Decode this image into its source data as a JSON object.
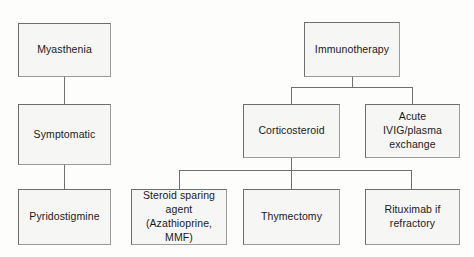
{
  "diagram": {
    "type": "flowchart",
    "colors": {
      "node_fill": "#f6f6f4",
      "node_border": "#6e6e6e",
      "edge": "#6f6f6f",
      "text": "#1a1a1a",
      "background": "#fdfdfc"
    },
    "nodes": [
      {
        "id": "myasthenia",
        "label": "Myasthenia"
      },
      {
        "id": "symptomatic",
        "label": "Symptomatic"
      },
      {
        "id": "pyridostigmine",
        "label": "Pyridostigmine"
      },
      {
        "id": "immunotherapy",
        "label": "Immunotherapy"
      },
      {
        "id": "corticosteroid",
        "label": "Corticosteroid"
      },
      {
        "id": "acute-ivig",
        "label": "Acute\nIVIG/plasma\nexchange"
      },
      {
        "id": "steroid-sparing",
        "label": "Steroid sparing\nagent\n(Azathioprine,\nMMF)"
      },
      {
        "id": "thymectomy",
        "label": "Thymectomy"
      },
      {
        "id": "rituximab",
        "label": "Rituximab if\nrefractory"
      }
    ],
    "edges": [
      {
        "from": "myasthenia",
        "to": "symptomatic"
      },
      {
        "from": "symptomatic",
        "to": "pyridostigmine"
      },
      {
        "from": "immunotherapy",
        "to": "corticosteroid"
      },
      {
        "from": "immunotherapy",
        "to": "acute-ivig"
      },
      {
        "from": "corticosteroid",
        "to": "steroid-sparing"
      },
      {
        "from": "corticosteroid",
        "to": "thymectomy"
      },
      {
        "from": "corticosteroid",
        "to": "rituximab"
      }
    ]
  }
}
